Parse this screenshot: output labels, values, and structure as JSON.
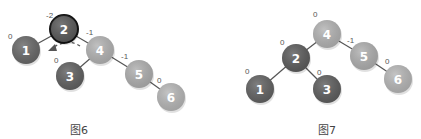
{
  "figures": [
    {
      "id": "fig6",
      "caption": "图6",
      "caption_pos": [
        70,
        121
      ],
      "nodes": [
        {
          "label": "2",
          "cx": 64,
          "cy": 29,
          "balance": "-2",
          "bx": 46,
          "by": 18,
          "color": "#5a5a5a",
          "highlight": true
        },
        {
          "label": "1",
          "cx": 26,
          "cy": 50,
          "balance": "0",
          "bx": 8,
          "by": 39,
          "color": "#6a6a6a"
        },
        {
          "label": "4",
          "cx": 100,
          "cy": 50,
          "balance": "-1",
          "bx": 86,
          "by": 35,
          "color": "#b4b4b4"
        },
        {
          "label": "3",
          "cx": 70,
          "cy": 76,
          "balance": "0",
          "bx": 54,
          "by": 63,
          "color": "#626262"
        },
        {
          "label": "5",
          "cx": 139,
          "cy": 74,
          "balance": "-1",
          "bx": 121,
          "by": 59,
          "color": "#b0b0b0"
        },
        {
          "label": "6",
          "cx": 171,
          "cy": 97,
          "balance": "0",
          "bx": 157,
          "by": 83,
          "color": "#b8b8b8"
        }
      ],
      "edges": [
        [
          0,
          1
        ],
        [
          0,
          2
        ],
        [
          2,
          3
        ],
        [
          2,
          4
        ],
        [
          4,
          5
        ]
      ],
      "rotation_arrow": true
    },
    {
      "id": "fig7",
      "caption": "图7",
      "caption_pos": [
        318,
        121
      ],
      "nodes": [
        {
          "label": "4",
          "cx": 327,
          "cy": 34,
          "balance": "0",
          "bx": 313,
          "by": 17,
          "color": "#b4b4b4"
        },
        {
          "label": "2",
          "cx": 296,
          "cy": 58,
          "balance": "0",
          "bx": 280,
          "by": 45,
          "color": "#5e5e5e"
        },
        {
          "label": "5",
          "cx": 364,
          "cy": 56,
          "balance": "-1",
          "bx": 347,
          "by": 43,
          "color": "#b0b0b0"
        },
        {
          "label": "1",
          "cx": 260,
          "cy": 89,
          "balance": "0",
          "bx": 245,
          "by": 74,
          "color": "#646464"
        },
        {
          "label": "3",
          "cx": 327,
          "cy": 89,
          "balance": "0",
          "bx": 317,
          "by": 75,
          "color": "#606060"
        },
        {
          "label": "6",
          "cx": 398,
          "cy": 79,
          "balance": "0",
          "bx": 385,
          "by": 64,
          "color": "#b8b8b8"
        }
      ],
      "edges": [
        [
          0,
          1
        ],
        [
          0,
          2
        ],
        [
          1,
          3
        ],
        [
          1,
          4
        ],
        [
          2,
          5
        ]
      ],
      "rotation_arrow": false
    }
  ]
}
